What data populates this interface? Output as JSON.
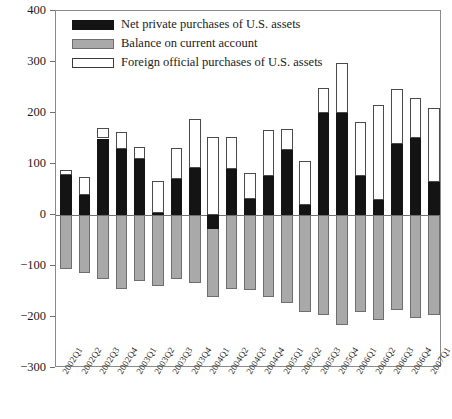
{
  "chart_data": {
    "type": "bar",
    "title": "",
    "subtitle": "",
    "xlabel": "",
    "ylabel": "",
    "ylim": [
      -300,
      400
    ],
    "ytick_values": [
      400,
      300,
      200,
      100,
      0,
      -100,
      -200,
      -300
    ],
    "ytick_labels": [
      "400",
      "300",
      "200",
      "100",
      "0",
      "−100",
      "−200",
      "−300"
    ],
    "grid": false,
    "stacked": true,
    "legend_position": "top-left",
    "categories": [
      "2002Q1",
      "2002Q2",
      "2002Q3",
      "2002Q4",
      "2003Q1",
      "2003Q2",
      "2003Q3",
      "2003Q4",
      "2004Q1",
      "2004Q2",
      "2004Q3",
      "2004Q4",
      "2005Q1",
      "2005Q2",
      "2005Q3",
      "2005Q4",
      "2006Q1",
      "2006Q2",
      "2006Q3",
      "2006Q4",
      "2007Q1"
    ],
    "series": [
      {
        "name": "Net private purchases of U.S. assets",
        "color": "#141414",
        "values": [
          78,
          40,
          150,
          130,
          110,
          3,
          70,
          93,
          -28,
          90,
          31,
          77,
          128,
          20,
          200,
          200,
          76,
          30,
          140,
          151,
          64
        ]
      },
      {
        "name": "Balance on current account",
        "color": "#a9a9a9",
        "values": [
          -105,
          -113,
          -125,
          -145,
          -130,
          -140,
          -125,
          -133,
          -160,
          -145,
          -148,
          -160,
          -172,
          -190,
          -196,
          -215,
          -190,
          -206,
          -186,
          -201,
          -197
        ]
      },
      {
        "name": "Foreign official purchases of U.S. assets",
        "color": "#ffffff",
        "values": [
          10,
          35,
          20,
          32,
          23,
          63,
          62,
          95,
          152,
          62,
          52,
          90,
          40,
          85,
          50,
          98,
          107,
          185,
          108,
          79,
          146
        ]
      }
    ],
    "stack_tops": {
      "note": "top of white segment = net private + foreign official",
      "values": [
        88,
        75,
        170,
        162,
        133,
        66,
        132,
        188,
        152,
        152,
        83,
        167,
        168,
        105,
        250,
        298,
        183,
        215,
        248,
        230,
        210
      ]
    }
  }
}
